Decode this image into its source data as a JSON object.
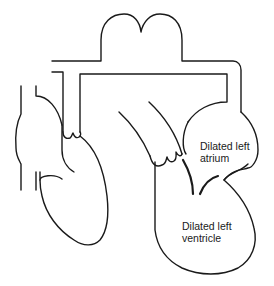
{
  "diagram": {
    "labels": {
      "left_atrium": {
        "line1": "Dilated left",
        "line2": "atrium"
      },
      "left_ventricle": {
        "line1": "Dilated left",
        "line2": "ventricle"
      }
    },
    "colors": {
      "stroke": "#1a1a1a",
      "background": "#ffffff"
    }
  }
}
